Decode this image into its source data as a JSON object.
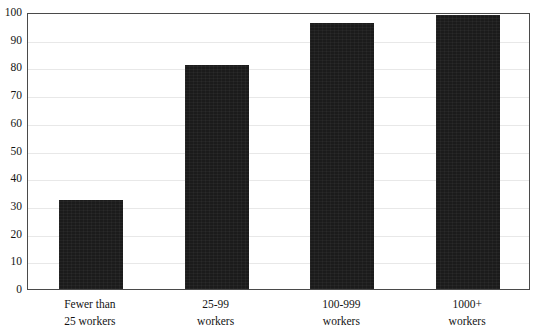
{
  "chart_data": {
    "type": "bar",
    "title": "",
    "xlabel": "",
    "ylabel": "",
    "categories": [
      "Fewer than 25 workers",
      "25-99 workers",
      "100-999 workers",
      "1000+ workers"
    ],
    "category_lines": [
      [
        "Fewer than",
        "25 workers"
      ],
      [
        "25-99",
        "workers"
      ],
      [
        "100-999",
        "workers"
      ],
      [
        "1000+",
        "workers"
      ]
    ],
    "values": [
      32,
      81,
      96,
      99
    ],
    "ylim": [
      0,
      100
    ],
    "ytick_values": [
      0,
      10,
      20,
      30,
      40,
      50,
      60,
      70,
      80,
      90,
      100
    ],
    "ytick_labels": [
      "0",
      "10",
      "20",
      "30",
      "40",
      "50",
      "60",
      "70",
      "80",
      "90",
      "100"
    ],
    "grid": true,
    "legend": false,
    "bar_color": "#1b1b1b",
    "grid_color": "#e8e8e8",
    "frame_color": "#4a4a4a",
    "text_color": "#141414"
  },
  "figure": {
    "title_remnant": ""
  }
}
